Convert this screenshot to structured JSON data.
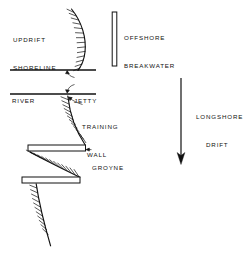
{
  "diagram": {
    "background_color": "#ffffff",
    "line_color": "#111111",
    "fill_color": "#ffffff",
    "width": 245,
    "height": 259,
    "labels": {
      "updrift_shoreline_line1": "UPDRIFT",
      "updrift_shoreline_line2": "SHORELINE",
      "river": "RIVER",
      "jetty": "JETTY",
      "training_wall_line1": "TRAINING",
      "training_wall_line2": "WALL",
      "groyne": "GROYNE",
      "offshore_breakwater_line1": "OFFSHORE",
      "offshore_breakwater_line2": "BREAKWATER",
      "longshore_drift_line1": "LONGSHORE",
      "longshore_drift_line2": "DRIFT"
    },
    "structures": [
      {
        "name": "offshore-breakwater",
        "type": "vertical-bar",
        "x": 112,
        "y_top": 12,
        "y_bottom": 66,
        "thickness": 5
      },
      {
        "name": "jetty-north",
        "type": "horizontal-line",
        "x_start": 10,
        "x_end": 96,
        "y": 70
      },
      {
        "name": "jetty-south",
        "type": "horizontal-line",
        "x_start": 10,
        "x_end": 96,
        "y": 94
      },
      {
        "name": "groyne-upper",
        "type": "horizontal-bar",
        "x_start": 28,
        "x_end": 85,
        "y_top": 145,
        "y_bottom": 151
      },
      {
        "name": "groyne-lower",
        "type": "horizontal-bar",
        "x_start": 22,
        "x_end": 80,
        "y_top": 177,
        "y_bottom": 183
      }
    ],
    "shoreline_segments": [
      {
        "name": "updrift-shoreline",
        "curvature": "convex-seaward",
        "from": [
          72,
          9
        ],
        "to": [
          78,
          70
        ],
        "bulge_x": 86
      },
      {
        "name": "downdrift-shoreline-segment-1",
        "curvature": "concave",
        "from": [
          68,
          96
        ],
        "to": [
          85,
          145
        ]
      },
      {
        "name": "downdrift-shoreline-segment-2",
        "curvature": "concave",
        "from": [
          30,
          152
        ],
        "to": [
          80,
          177
        ]
      },
      {
        "name": "downdrift-shoreline-segment-3",
        "curvature": "near-straight",
        "from": [
          36,
          184
        ],
        "to": [
          51,
          246
        ]
      }
    ],
    "annotation_arrow": {
      "name": "longshore-drift-arrow",
      "direction": "down",
      "x": 181,
      "y_start": 78,
      "y_end": 163
    },
    "leaders": [
      {
        "name": "jetty-leader-upper",
        "to": [
          67,
          72
        ]
      },
      {
        "name": "jetty-leader-lower",
        "to": [
          67,
          92
        ]
      },
      {
        "name": "training-wall-leader",
        "to": [
          69,
          97
        ]
      },
      {
        "name": "groyne-leader",
        "to": [
          86,
          150
        ]
      }
    ]
  }
}
